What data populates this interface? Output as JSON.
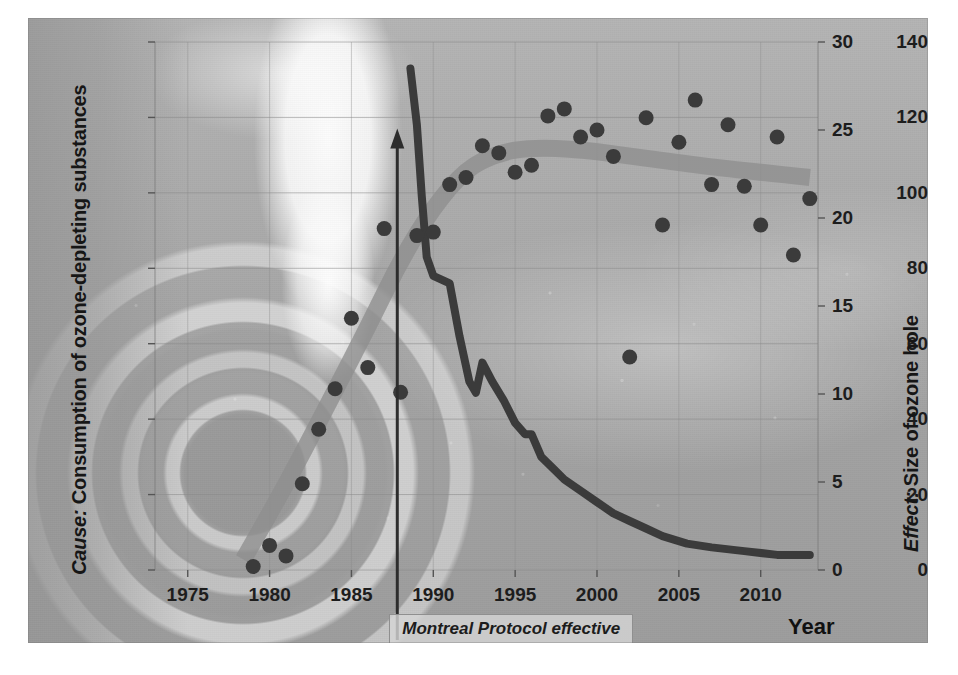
{
  "chart_data": {
    "type": "scatter",
    "title": "",
    "subtitle": "",
    "xlabel": "Year",
    "xlim": [
      1973,
      2013.5
    ],
    "x_ticks": [
      1975,
      1980,
      1985,
      1990,
      1995,
      2000,
      2005,
      2010
    ],
    "x_tick_labels": [
      "1975",
      "1980",
      "1985",
      "1990",
      "1995",
      "2000",
      "2005",
      "2010"
    ],
    "grid": true,
    "legend": "none",
    "axes": [
      {
        "id": "left",
        "lead": "Cause:",
        "label": "Consumption of ozone-depleting substances",
        "ylim": [
          0,
          140
        ],
        "ticks": [
          0,
          20,
          40,
          60,
          80,
          100,
          120,
          140
        ],
        "tick_labels": [
          "0",
          "20",
          "40",
          "60",
          "80",
          "100",
          "120",
          "140"
        ]
      },
      {
        "id": "right",
        "lead": "Effect:",
        "label": "Size of ozone hole",
        "ylim": [
          0,
          30
        ],
        "ticks": [
          0,
          5,
          10,
          15,
          20,
          25,
          30
        ],
        "tick_labels": [
          "0",
          "5",
          "10",
          "15",
          "20",
          "25",
          "30"
        ]
      }
    ],
    "series": [
      {
        "name": "Size of ozone hole",
        "type": "scatter",
        "axis": "right",
        "color": "#3b3b3b",
        "marker": "circle",
        "points": [
          [
            1979,
            0.2
          ],
          [
            1980,
            1.4
          ],
          [
            1981,
            0.8
          ],
          [
            1982,
            4.9
          ],
          [
            1983,
            8.0
          ],
          [
            1984,
            10.3
          ],
          [
            1985,
            14.3
          ],
          [
            1986,
            11.5
          ],
          [
            1987,
            19.4
          ],
          [
            1988,
            10.1
          ],
          [
            1989,
            19.0
          ],
          [
            1990,
            19.2
          ],
          [
            1991,
            21.9
          ],
          [
            1992,
            22.3
          ],
          [
            1993,
            24.1
          ],
          [
            1994,
            23.7
          ],
          [
            1995,
            22.6
          ],
          [
            1996,
            23.0
          ],
          [
            1997,
            25.8
          ],
          [
            1998,
            26.2
          ],
          [
            1999,
            24.6
          ],
          [
            2000,
            25.0
          ],
          [
            2001,
            23.5
          ],
          [
            2002,
            12.1
          ],
          [
            2003,
            25.7
          ],
          [
            2004,
            19.6
          ],
          [
            2005,
            24.3
          ],
          [
            2006,
            26.7
          ],
          [
            2007,
            21.9
          ],
          [
            2008,
            25.3
          ],
          [
            2009,
            21.8
          ],
          [
            2010,
            19.6
          ],
          [
            2011,
            24.6
          ],
          [
            2012,
            17.9
          ],
          [
            2013,
            21.1
          ]
        ]
      },
      {
        "name": "Consumption of ozone-depleting substances",
        "type": "line",
        "axis": "left",
        "color": "#3b3b3b",
        "points": [
          [
            1988.6,
            133
          ],
          [
            1989.0,
            118
          ],
          [
            1989.3,
            99
          ],
          [
            1989.6,
            83
          ],
          [
            1990.0,
            78
          ],
          [
            1991.0,
            76
          ],
          [
            1991.6,
            62
          ],
          [
            1992.2,
            50
          ],
          [
            1992.6,
            47
          ],
          [
            1993.0,
            55
          ],
          [
            1993.6,
            50
          ],
          [
            1994.3,
            45
          ],
          [
            1995.0,
            39
          ],
          [
            1995.6,
            36
          ],
          [
            1996.0,
            36
          ],
          [
            1996.6,
            30
          ],
          [
            1997.3,
            27
          ],
          [
            1998.0,
            24
          ],
          [
            1999.0,
            21
          ],
          [
            2000.0,
            18
          ],
          [
            2001.0,
            15
          ],
          [
            2002.0,
            13
          ],
          [
            2003.0,
            11
          ],
          [
            2004.0,
            9
          ],
          [
            2005.5,
            7
          ],
          [
            2007.0,
            6
          ],
          [
            2009.0,
            5
          ],
          [
            2011.0,
            4
          ],
          [
            2013.0,
            4
          ]
        ]
      },
      {
        "name": "Ozone hole trend",
        "type": "trend-band",
        "axis": "right",
        "color": "#8e8e8e",
        "points": [
          [
            1978.4,
            0.6
          ],
          [
            1980,
            3.2
          ],
          [
            1982,
            6.6
          ],
          [
            1984,
            10.2
          ],
          [
            1986,
            13.8
          ],
          [
            1988,
            17.6
          ],
          [
            1990,
            20.6
          ],
          [
            1992,
            22.8
          ],
          [
            1994,
            23.7
          ],
          [
            1996,
            24.0
          ],
          [
            1999,
            23.9
          ],
          [
            2003,
            23.4
          ],
          [
            2007,
            22.9
          ],
          [
            2010,
            22.6
          ],
          [
            2013,
            22.3
          ]
        ]
      }
    ],
    "annotations": [
      {
        "name": "montreal-protocol",
        "text": "Montreal Protocol effective",
        "x": 1987.8,
        "marker": "vertical-line-with-up-arrow",
        "arrow_top_value_left_axis": 116
      }
    ]
  },
  "axis_x": {
    "title": "Year"
  }
}
